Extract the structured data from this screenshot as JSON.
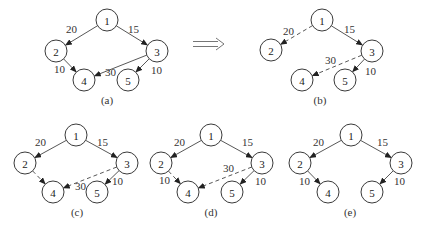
{
  "figure": {
    "node_radius": 11,
    "colors": {
      "stroke": "#3a3a3a",
      "edge": "#444444",
      "background": "#ffffff"
    },
    "transition_arrow": {
      "symbol": "⟹",
      "x1": 193,
      "x2": 224,
      "y": 44
    },
    "panels": [
      {
        "id": "a",
        "label": "(a)",
        "label_pos": [
          107,
          104
        ],
        "nodes": [
          {
            "id": "1",
            "x": 107,
            "y": 20
          },
          {
            "id": "2",
            "x": 56,
            "y": 51
          },
          {
            "id": "3",
            "x": 157,
            "y": 51
          },
          {
            "id": "4",
            "x": 84,
            "y": 80
          },
          {
            "id": "5",
            "x": 128,
            "y": 80
          }
        ],
        "edges": [
          {
            "from": "1",
            "to": "2",
            "weight": "20",
            "style": "solid",
            "lx": 66,
            "ly": 33
          },
          {
            "from": "1",
            "to": "3",
            "weight": "15",
            "style": "solid",
            "lx": 128,
            "ly": 33
          },
          {
            "from": "2",
            "to": "4",
            "weight": "10",
            "style": "solid",
            "lx": 54,
            "ly": 73
          },
          {
            "from": "3",
            "to": "4",
            "weight": "30",
            "style": "solid",
            "lx": 105,
            "ly": 76
          },
          {
            "from": "3",
            "to": "5",
            "weight": "10",
            "style": "solid",
            "lx": 151,
            "ly": 74
          }
        ]
      },
      {
        "id": "b",
        "label": "(b)",
        "label_pos": [
          320,
          104
        ],
        "nodes": [
          {
            "id": "1",
            "x": 322,
            "y": 20
          },
          {
            "id": "2",
            "x": 271,
            "y": 50
          },
          {
            "id": "3",
            "x": 372,
            "y": 51
          },
          {
            "id": "4",
            "x": 302,
            "y": 80
          },
          {
            "id": "5",
            "x": 345,
            "y": 80
          }
        ],
        "edges": [
          {
            "from": "1",
            "to": "2",
            "weight": "20",
            "style": "dashed",
            "lx": 283,
            "ly": 35
          },
          {
            "from": "1",
            "to": "3",
            "weight": "15",
            "style": "solid",
            "lx": 344,
            "ly": 33
          },
          {
            "from": "3",
            "to": "4",
            "weight": "30",
            "style": "dashed",
            "lx": 325,
            "ly": 64
          },
          {
            "from": "3",
            "to": "5",
            "weight": "10",
            "style": "solid",
            "lx": 365,
            "ly": 75
          }
        ]
      },
      {
        "id": "c",
        "label": "(c)",
        "label_pos": [
          77,
          216
        ],
        "nodes": [
          {
            "id": "1",
            "x": 76,
            "y": 135
          },
          {
            "id": "2",
            "x": 25,
            "y": 163
          },
          {
            "id": "3",
            "x": 127,
            "y": 163
          },
          {
            "id": "4",
            "x": 53,
            "y": 192
          },
          {
            "id": "5",
            "x": 97,
            "y": 192
          }
        ],
        "edges": [
          {
            "from": "1",
            "to": "2",
            "weight": "20",
            "style": "solid",
            "lx": 35,
            "ly": 146
          },
          {
            "from": "1",
            "to": "3",
            "weight": "15",
            "style": "solid",
            "lx": 97,
            "ly": 146
          },
          {
            "from": "2",
            "to": "4",
            "weight": "",
            "style": "dashed",
            "lx": 0,
            "ly": 0
          },
          {
            "from": "3",
            "to": "4",
            "weight": "30",
            "style": "dashed",
            "lx": 75,
            "ly": 190
          },
          {
            "from": "3",
            "to": "5",
            "weight": "10",
            "style": "solid",
            "lx": 112,
            "ly": 185
          }
        ]
      },
      {
        "id": "d",
        "label": "(d)",
        "label_pos": [
          211,
          216
        ],
        "nodes": [
          {
            "id": "1",
            "x": 211,
            "y": 135
          },
          {
            "id": "2",
            "x": 161,
            "y": 163
          },
          {
            "id": "3",
            "x": 262,
            "y": 163
          },
          {
            "id": "4",
            "x": 188,
            "y": 192
          },
          {
            "id": "5",
            "x": 232,
            "y": 192
          }
        ],
        "edges": [
          {
            "from": "1",
            "to": "2",
            "weight": "20",
            "style": "solid",
            "lx": 174,
            "ly": 146
          },
          {
            "from": "1",
            "to": "3",
            "weight": "15",
            "style": "solid",
            "lx": 242,
            "ly": 146
          },
          {
            "from": "2",
            "to": "4",
            "weight": "10",
            "style": "dashed",
            "lx": 159,
            "ly": 184
          },
          {
            "from": "3",
            "to": "4",
            "weight": "30",
            "style": "dashed",
            "lx": 223,
            "ly": 172
          },
          {
            "from": "3",
            "to": "5",
            "weight": "10",
            "style": "solid",
            "lx": 255,
            "ly": 185
          }
        ]
      },
      {
        "id": "e",
        "label": "(e)",
        "label_pos": [
          350,
          216
        ],
        "nodes": [
          {
            "id": "1",
            "x": 351,
            "y": 135
          },
          {
            "id": "2",
            "x": 300,
            "y": 163
          },
          {
            "id": "3",
            "x": 401,
            "y": 163
          },
          {
            "id": "4",
            "x": 328,
            "y": 192
          },
          {
            "id": "5",
            "x": 372,
            "y": 192
          }
        ],
        "edges": [
          {
            "from": "1",
            "to": "2",
            "weight": "20",
            "style": "solid",
            "lx": 313,
            "ly": 146
          },
          {
            "from": "1",
            "to": "3",
            "weight": "15",
            "style": "solid",
            "lx": 377,
            "ly": 146
          },
          {
            "from": "2",
            "to": "4",
            "weight": "10",
            "style": "solid",
            "lx": 299,
            "ly": 185
          },
          {
            "from": "3",
            "to": "5",
            "weight": "10",
            "style": "solid",
            "lx": 394,
            "ly": 185
          }
        ]
      }
    ]
  }
}
